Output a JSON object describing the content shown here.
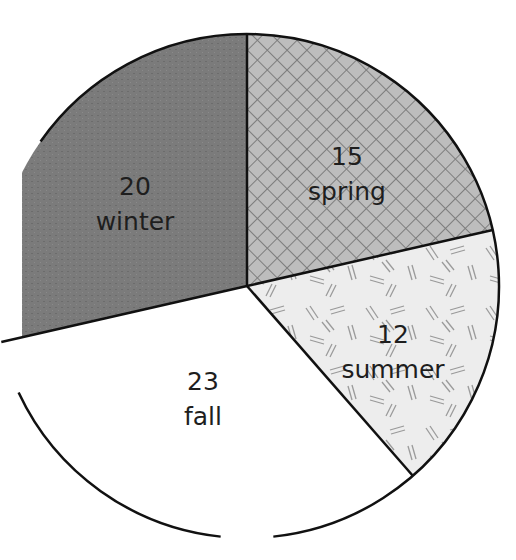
{
  "chart_data": {
    "type": "pie",
    "title": "",
    "start_angle_deg": -90,
    "direction": "clockwise",
    "categories": [
      "spring",
      "summer",
      "fall",
      "winter"
    ],
    "values": [
      15,
      12,
      23,
      20
    ],
    "slices": [
      {
        "label": "spring",
        "value": 15,
        "value_text": "15",
        "fill": "#b9b9b9",
        "pattern": "crosshatch"
      },
      {
        "label": "summer",
        "value": 12,
        "value_text": "12",
        "fill": "#ececec",
        "pattern": "scattered-double-dashes"
      },
      {
        "label": "fall",
        "value": 23,
        "value_text": "23",
        "fill": "#ffffff",
        "pattern": "none"
      },
      {
        "label": "winter",
        "value": 20,
        "value_text": "20",
        "fill": "#7a7a7a",
        "pattern": "stipple"
      }
    ],
    "legend": "none",
    "labels_inside": true
  }
}
